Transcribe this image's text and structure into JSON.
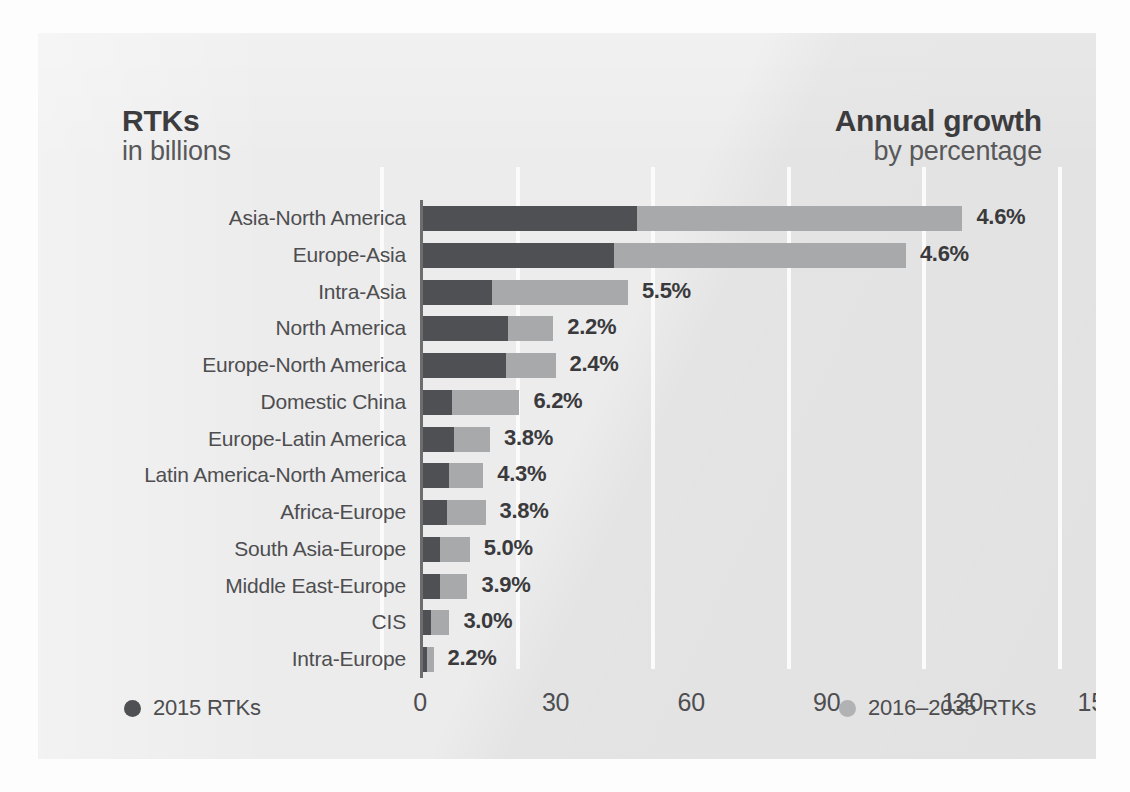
{
  "headings": {
    "left_title": "RTKs",
    "left_subtitle": "in billions",
    "right_title": "Annual growth",
    "right_subtitle": "by percentage"
  },
  "legend": {
    "past_label": "2015 RTKs",
    "future_label": "2016–2035 RTKs",
    "past_color": "#4f5053",
    "future_color": "#a8a9ab"
  },
  "chart_data": {
    "type": "bar",
    "orientation": "horizontal",
    "stacked": true,
    "xlabel": "",
    "ylabel": "",
    "xlim": [
      0,
      150
    ],
    "xticks": [
      "0",
      "30",
      "60",
      "90",
      "120",
      "150"
    ],
    "grid": true,
    "legend_position": "bottom",
    "categories": [
      "Asia-North America",
      "Europe-Asia",
      "Intra-Asia",
      "North America",
      "Europe-North America",
      "Domestic China",
      "Europe-Latin America",
      "Latin America-North America",
      "Africa-Europe",
      "South Asia-Europe",
      "Middle East-Europe",
      "CIS",
      "Intra-Europe"
    ],
    "series": [
      {
        "name": "2015 RTKs",
        "color": "#4f5053",
        "values": [
          48.0,
          43.0,
          16.0,
          19.5,
          19.0,
          7.0,
          7.5,
          6.5,
          6.0,
          4.5,
          4.5,
          2.5,
          1.5
        ]
      },
      {
        "name": "2016–2035 RTKs",
        "color": "#a8a9ab",
        "values": [
          72.0,
          64.5,
          30.0,
          10.0,
          11.0,
          15.0,
          8.0,
          7.5,
          8.5,
          6.5,
          6.0,
          4.0,
          1.5
        ]
      }
    ],
    "totals": [
      120.0,
      107.5,
      46.0,
      29.5,
      30.0,
      22.0,
      15.5,
      14.0,
      14.5,
      11.0,
      10.5,
      6.5,
      3.0
    ],
    "annual_growth_percent": [
      "4.6%",
      "4.6%",
      "5.5%",
      "2.2%",
      "2.4%",
      "6.2%",
      "3.8%",
      "4.3%",
      "3.8%",
      "5.0%",
      "3.9%",
      "3.0%",
      "2.2%"
    ]
  }
}
